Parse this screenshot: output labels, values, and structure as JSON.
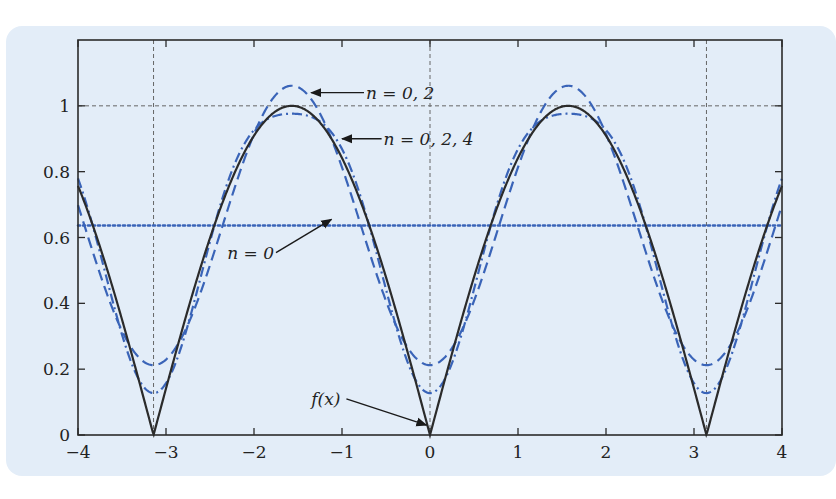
{
  "chart_data": {
    "type": "line",
    "title": "",
    "xlabel": "",
    "ylabel": "",
    "xlim": [
      -4,
      4
    ],
    "ylim": [
      0,
      1.2
    ],
    "grid": {
      "x": [
        -3.14159,
        0,
        3.14159
      ],
      "y": [
        1
      ]
    },
    "x_ticks": [
      -4,
      -3,
      -2,
      -1,
      0,
      1,
      2,
      3,
      4
    ],
    "x_tick_labels": [
      "−4",
      "−3",
      "−2",
      "−1",
      "0",
      "1",
      "2",
      "3",
      "4"
    ],
    "y_ticks": [
      0,
      0.2,
      0.4,
      0.6,
      0.8,
      1
    ],
    "y_tick_labels": [
      "0",
      "0.2",
      "0.4",
      "0.6",
      "0.8",
      "1"
    ],
    "series": [
      {
        "name": "f(x)",
        "formula": "|sin x|",
        "style": "solid",
        "color": "#2b2b2b",
        "sample_points": {
          "x": [
            -4,
            -3.14159,
            -1.5708,
            0,
            1.5708,
            3.14159,
            4
          ],
          "y": [
            0.757,
            0,
            1,
            0,
            1,
            0,
            0.757
          ]
        }
      },
      {
        "name": "n = 0",
        "formula": "2/pi",
        "style": "dotted",
        "color": "#3a64b8",
        "sample_points": {
          "x": [
            -4,
            4
          ],
          "y": [
            0.637,
            0.637
          ]
        }
      },
      {
        "name": "n = 0, 2",
        "formula": "2/pi - (4/(3pi)) cos 2x",
        "style": "dashed",
        "color": "#3a64b8",
        "sample_points": {
          "x": [
            -3.14159,
            -1.5708,
            0,
            1.5708,
            3.14159
          ],
          "y": [
            0.212,
            1.061,
            0.212,
            1.061,
            0.212
          ]
        }
      },
      {
        "name": "n = 0, 2, 4",
        "formula": "2/pi - (4/(3pi)) cos 2x - (4/(15pi)) cos 4x",
        "style": "dashdot",
        "color": "#3a64b8",
        "sample_points": {
          "x": [
            -3.14159,
            -1.5708,
            0,
            1.5708,
            3.14159
          ],
          "y": [
            0.127,
            0.976,
            0.127,
            0.976,
            0.127
          ]
        }
      }
    ],
    "coefficients": {
      "a0_half": 0.63662,
      "terms": [
        {
          "n": 2,
          "coef": -0.42441
        },
        {
          "n": 4,
          "coef": -0.08488
        }
      ]
    },
    "annotations": [
      {
        "text": "n = 0, 2",
        "target": "n = 0, 2",
        "arrow_to": [
          -1.35,
          1.04
        ],
        "label_at": [
          -0.75,
          1.04
        ]
      },
      {
        "text": "n = 0, 2, 4",
        "target": "n = 0, 2, 4",
        "arrow_to": [
          -1.0,
          0.9
        ],
        "label_at": [
          -0.55,
          0.9
        ]
      },
      {
        "text": "n = 0",
        "target": "n = 0",
        "arrow_to": [
          -1.12,
          0.655
        ],
        "label_at": [
          -1.75,
          0.56
        ]
      },
      {
        "text": "f(x)",
        "target": "f(x)",
        "arrow_to": [
          -0.04,
          0.03
        ],
        "label_at": [
          -0.95,
          0.11
        ]
      }
    ],
    "legend": null
  },
  "labels": {
    "ann_n02": "n = 0, 2",
    "ann_n024": "n = 0, 2, 4",
    "ann_n0": "n = 0",
    "ann_fx": "f(x)"
  },
  "colors": {
    "panel_bg": "#e3edf8",
    "axis": "#2b2b2b",
    "grid": "#666666",
    "series_blue": "#3a64b8",
    "series_black": "#2b2b2b"
  }
}
